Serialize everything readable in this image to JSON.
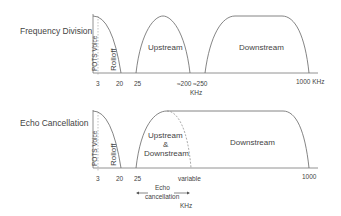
{
  "panels": [
    {
      "title": "Frequency Division",
      "pots_label": "POTS Voice",
      "rolloff_label": "Rolloff",
      "band1_label": "Upstream",
      "band2_label": "Downstream",
      "ticks": [
        "3",
        "20",
        "25",
        "≈200",
        "≈250",
        "1000 KHz"
      ],
      "unit_label": "KHz"
    },
    {
      "title": "Echo Cancellation",
      "pots_label": "POTS Voice",
      "rolloff_label": "Rolloff",
      "band1_label_line1": "Upstream",
      "band1_label_line2": "&",
      "band1_label_line3": "Downstream",
      "band2_label": "Downstream",
      "ticks": [
        "3",
        "20",
        "25",
        "variable",
        "1000"
      ],
      "echo_label_line1": "Echo",
      "echo_label_line2": "cancellation",
      "unit_label": "KHz"
    }
  ]
}
